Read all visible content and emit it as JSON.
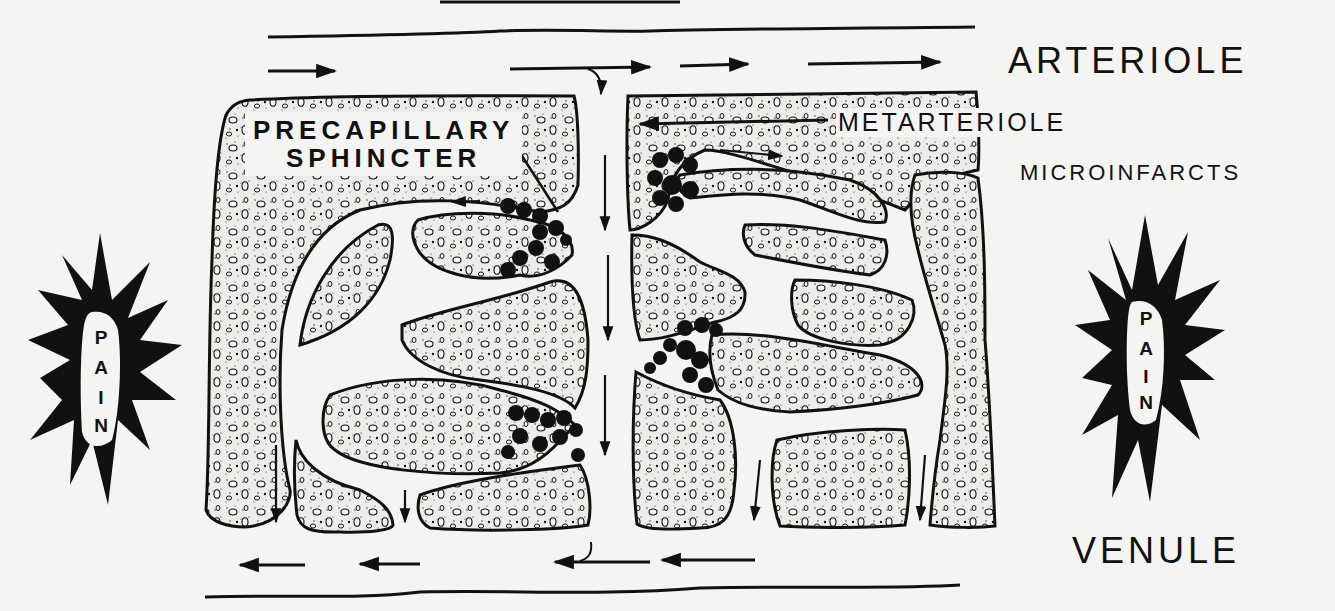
{
  "diagram": {
    "colors": {
      "ink": "#111111",
      "paper": "#f4f4f2",
      "tissue": "#e6e6e2"
    },
    "labels": {
      "arteriole": "ARTERIOLE",
      "venule": "VENULE",
      "metarteriole": "METARTERIOLE",
      "microinfarcts": "MICROINFARCTS",
      "precapillary_line1": "PRECAPILLARY",
      "precapillary_line2": "SPHINCTER"
    },
    "pain_left": {
      "letters": [
        "P",
        "A",
        "I",
        "N"
      ]
    },
    "pain_right": {
      "letters": [
        "P",
        "A",
        "I",
        "N"
      ]
    },
    "flow": {
      "arteriole_direction": "right",
      "venule_direction": "left",
      "capillary_direction": "down"
    }
  }
}
